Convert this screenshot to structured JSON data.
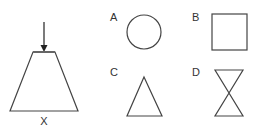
{
  "figure": {
    "main_shape": {
      "label": "X",
      "type": "trapezoid",
      "has_arrow": true,
      "arrow_direction": "down"
    },
    "options": [
      {
        "label": "A",
        "shape": "circle"
      },
      {
        "label": "B",
        "shape": "square"
      },
      {
        "label": "C",
        "shape": "triangle"
      },
      {
        "label": "D",
        "shape": "hourglass"
      }
    ]
  },
  "colors": {
    "stroke": "#444444",
    "text": "#333333",
    "background": "#ffffff"
  }
}
